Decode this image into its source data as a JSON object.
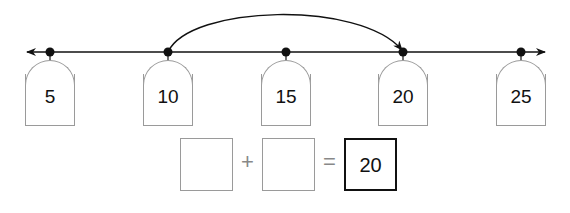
{
  "number_line": {
    "ticks": [
      {
        "value": "5",
        "x": 50
      },
      {
        "value": "10",
        "x": 168
      },
      {
        "value": "15",
        "x": 286
      },
      {
        "value": "20",
        "x": 403
      },
      {
        "value": "25",
        "x": 521
      }
    ],
    "jump": {
      "from": "10",
      "to": "20"
    }
  },
  "equation": {
    "addend1": "",
    "plus": "+",
    "addend2": "",
    "equals": "=",
    "sum": "20"
  }
}
